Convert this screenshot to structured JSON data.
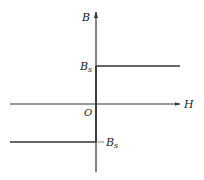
{
  "diagram": {
    "type": "B-H saturation curve (ideal)",
    "axes": {
      "y_label": "B",
      "x_label": "H",
      "origin_label": "O"
    },
    "levels": {
      "positive": {
        "base": "B",
        "sub": "s",
        "prefix": ""
      },
      "negative": {
        "base": "B",
        "sub": "s",
        "prefix": "−"
      }
    },
    "colors": {
      "line": "#333333",
      "text": "#222222",
      "background": "#ffffff"
    }
  }
}
